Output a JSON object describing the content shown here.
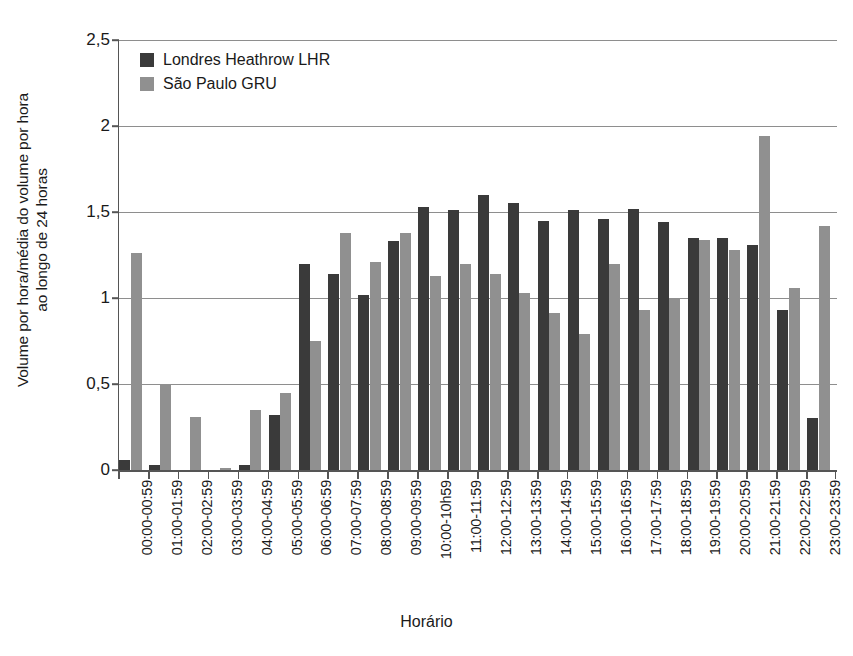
{
  "chart_data": {
    "type": "bar",
    "title": "",
    "xlabel": "Horário",
    "ylabel_line1": "Volume por hora/média do volume por hora",
    "ylabel_line2": "ao longo de 24 horas",
    "ylim": [
      0,
      2.5
    ],
    "yticks": [
      0,
      0.5,
      1,
      1.5,
      2,
      2.5
    ],
    "ytick_labels": [
      "0",
      "0,5",
      "1",
      "1,5",
      "2",
      "2,5"
    ],
    "grid": true,
    "legend_position": "top-left-inside",
    "categories": [
      "00:00-00:59",
      "01:00-01:59",
      "02:00-02:59",
      "03:00-03:59",
      "04:00-04:59",
      "05:00-05:59",
      "06:00-06:59",
      "07:00-07:59",
      "08:00-08:59",
      "09:00-09:59",
      "10:00-10h59",
      "11:00-11:59",
      "12:00-12:59",
      "13:00-13:59",
      "14:00-14:59",
      "15:00-15:59",
      "16:00-16:59",
      "17:00-17:59",
      "18:00-18:59",
      "19:00-19:59",
      "20:00-20:59",
      "21:00-21:59",
      "22:00-22:59",
      "23:00-23:59"
    ],
    "series": [
      {
        "name": "Londres Heathrow LHR",
        "color": "#3a3a3a",
        "values": [
          0.06,
          0.03,
          0.0,
          0.0,
          0.03,
          0.32,
          1.2,
          1.14,
          1.02,
          1.33,
          1.53,
          1.51,
          1.6,
          1.55,
          1.45,
          1.51,
          1.46,
          1.52,
          1.44,
          1.35,
          1.35,
          1.31,
          0.93,
          0.3
        ]
      },
      {
        "name": "São Paulo GRU",
        "color": "#909090",
        "values": [
          1.26,
          0.5,
          0.31,
          0.01,
          0.35,
          0.45,
          0.75,
          1.38,
          1.21,
          1.38,
          1.13,
          1.2,
          1.14,
          1.03,
          0.91,
          0.79,
          1.2,
          0.93,
          1.0,
          1.34,
          1.28,
          1.94,
          1.06,
          1.42
        ]
      }
    ]
  }
}
